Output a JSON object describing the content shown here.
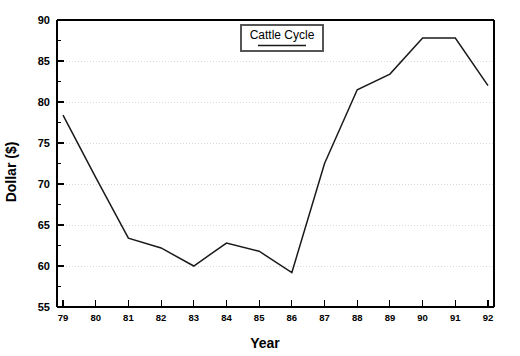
{
  "chart_data": {
    "type": "line",
    "title": "",
    "xlabel": "Year",
    "ylabel": "Dollar ($)",
    "categories": [
      "79",
      "80",
      "81",
      "82",
      "83",
      "84",
      "85",
      "86",
      "87",
      "88",
      "89",
      "90",
      "91",
      "92"
    ],
    "x": [
      79,
      80,
      81,
      82,
      83,
      84,
      85,
      86,
      87,
      88,
      89,
      90,
      91,
      92
    ],
    "series": [
      {
        "name": "Cattle Cycle",
        "values": [
          78.4,
          70.8,
          63.4,
          62.2,
          60.0,
          62.8,
          61.8,
          59.2,
          72.5,
          81.5,
          83.4,
          87.8,
          87.8,
          82.0
        ],
        "color": "#1a1a1a"
      }
    ],
    "ylim": [
      55,
      90
    ],
    "ytick_values": [
      55,
      60,
      65,
      70,
      75,
      80,
      85,
      90
    ],
    "ytick_labels": [
      "55",
      "60",
      "65",
      "70",
      "75",
      "80",
      "85",
      "90"
    ],
    "xtick_labels": [
      "79",
      "80",
      "81",
      "82",
      "83",
      "84",
      "85",
      "86",
      "87",
      "88",
      "89",
      "90",
      "91",
      "92"
    ],
    "grid": true,
    "grid_axis": "y",
    "legend_position": "top-center",
    "legend_entries": [
      "Cattle Cycle"
    ]
  },
  "legend": {
    "label": "Cattle Cycle"
  },
  "axes": {
    "y_title": "Dollar ($)",
    "x_title": "Year"
  },
  "colors": {
    "line": "#1a1a1a",
    "grid": "#c9c9c9",
    "axis": "#000000",
    "background": "#ffffff"
  }
}
